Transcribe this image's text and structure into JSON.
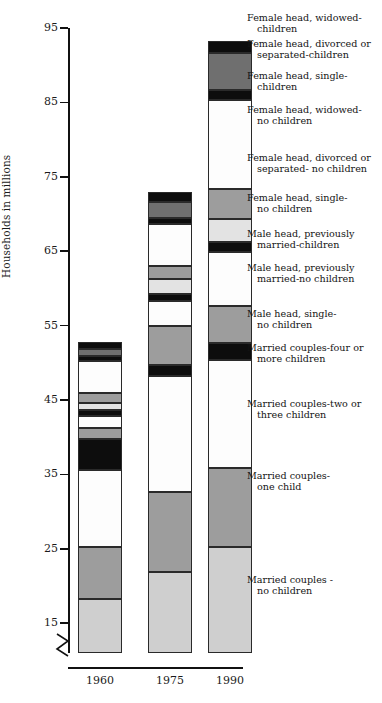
{
  "chart_data": {
    "type": "bar",
    "subtype": "stacked-bar",
    "title": "",
    "xlabel": "",
    "ylabel": "Households in millions",
    "categories": [
      "1960",
      "1975",
      "1990"
    ],
    "ylim": [
      11,
      95
    ],
    "yticks": [
      15,
      25,
      35,
      45,
      55,
      65,
      75,
      85,
      95
    ],
    "ytick_labels": [
      "15",
      "25",
      "35",
      "45",
      "55",
      "65",
      "75",
      "85",
      "95"
    ],
    "axis_break": true,
    "axis_break_note": "y-axis broken below 15",
    "grid": false,
    "legend_position": "right",
    "series": [
      {
        "name": "Married couples-\nno children",
        "fill": "light-gray",
        "color": "#cfcfcf",
        "values": [
          18.3,
          21.9,
          25.2
        ]
      },
      {
        "name": "Married couples-\none child",
        "fill": "medium-gray",
        "color": "#9d9d9d",
        "values": [
          25.2,
          32.6,
          35.8
        ]
      },
      {
        "name": "Married couples-two or\nthree children",
        "fill": "white",
        "color": "#fdfdfd",
        "values": [
          35.6,
          48.2,
          50.4
        ]
      },
      {
        "name": "Married couples-four or\nmore children",
        "fill": "black",
        "color": "#0d0d0d",
        "values": [
          39.7,
          49.7,
          52.7
        ]
      },
      {
        "name": "Male head, single-\nno children",
        "fill": "medium-gray",
        "color": "#9d9d9d",
        "values": [
          41.3,
          55.0,
          57.6
        ]
      },
      {
        "name": "Male head, previously\nmarried-no children",
        "fill": "white",
        "color": "#fdfdfd",
        "values": [
          42.8,
          58.3,
          64.9
        ]
      },
      {
        "name": "Male head, previously\nmarried-children",
        "fill": "black",
        "color": "#0d0d0d",
        "values": [
          43.6,
          59.2,
          66.2
        ]
      },
      {
        "name": "Female head, single-\nno children",
        "fill": "pale-gray",
        "color": "#e3e3e3",
        "values": [
          44.6,
          61.2,
          69.3
        ]
      },
      {
        "name": "Female head, divorced or\nseparated- no children",
        "fill": "medium-gray",
        "color": "#9d9d9d",
        "values": [
          46.0,
          63.0,
          73.4
        ]
      },
      {
        "name": "Female head, widowed-\nno children",
        "fill": "white",
        "color": "#fdfdfd",
        "values": [
          50.3,
          68.6,
          85.3
        ]
      },
      {
        "name": "Female head, single-\nchildren",
        "fill": "black",
        "color": "#0d0d0d",
        "values": [
          50.9,
          69.4,
          86.7
        ]
      },
      {
        "name": "Female head, divorced or\nseparated-children",
        "fill": "dark-gray",
        "color": "#6f6f6f",
        "values": [
          51.8,
          71.6,
          91.6
        ]
      },
      {
        "name": "Female head, widowed-\nchildren",
        "fill": "black",
        "color": "#0d0d0d",
        "values": [
          52.8,
          72.9,
          93.3
        ]
      }
    ],
    "totals": [
      52.8,
      72.9,
      93.3
    ]
  },
  "legend": {
    "items": [
      {
        "line1": "Female head, widowed-",
        "line2": "children"
      },
      {
        "line1": "Female head, divorced or",
        "line2": "separated-children"
      },
      {
        "line1": "Female head, single-",
        "line2": "children"
      },
      {
        "line1": "Female head, widowed-",
        "line2": "no children"
      },
      {
        "line1": "Female head, divorced or",
        "line2": "separated- no children"
      },
      {
        "line1": "Female head, single-",
        "line2": "no children"
      },
      {
        "line1": "Male head, previously",
        "line2": "married-children"
      },
      {
        "line1": "Male head, previously",
        "line2": "married-no children"
      },
      {
        "line1": "Male head, single-",
        "line2": "no children"
      },
      {
        "line1": "Married couples-four or",
        "line2": "more children"
      },
      {
        "line1": "Married couples-two or",
        "line2": "three children"
      },
      {
        "line1": "Married couples-",
        "line2": "one child"
      },
      {
        "line1": "Married couples -",
        "line2": "no children"
      }
    ]
  },
  "axis": {
    "ytitle": "Households in millions",
    "yticks": [
      "95",
      "85",
      "75",
      "65",
      "55",
      "45",
      "35",
      "25",
      "15"
    ],
    "xticks": [
      "1960",
      "1975",
      "1990"
    ]
  }
}
